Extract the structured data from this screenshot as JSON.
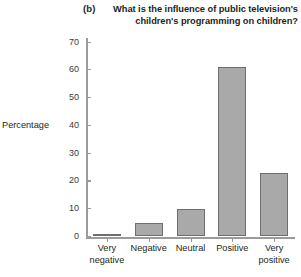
{
  "panel": {
    "label": "(b)"
  },
  "title": {
    "line1": "What is the influence of public television's",
    "line2": "children's programming on children?"
  },
  "axis": {
    "y_title": "Percentage"
  },
  "colors": {
    "bar_fill": "#a9a9a9",
    "bar_edge": "#6e6e6e",
    "axis": "#9b9b9b",
    "text": "#231f20",
    "background": "#ffffff"
  },
  "chart_data": {
    "type": "bar",
    "title": "What is the influence of public television's children's programming on children?",
    "xlabel": "",
    "ylabel": "Percentage",
    "categories": [
      "Very negative",
      "Negative",
      "Neutral",
      "Positive",
      "Very positive"
    ],
    "category_lines": [
      [
        "Very",
        "negative"
      ],
      [
        "Negative",
        ""
      ],
      [
        "Neutral",
        ""
      ],
      [
        "Positive",
        ""
      ],
      [
        "Very",
        "positive"
      ]
    ],
    "values": [
      1,
      5,
      10,
      61,
      23
    ],
    "ylim": [
      0,
      70
    ],
    "yticks": [
      0,
      10,
      20,
      30,
      40,
      50,
      60,
      70
    ],
    "ytick_labels": [
      "0",
      "10",
      "20",
      "30",
      "40",
      "50",
      "60",
      "70"
    ],
    "grid": false,
    "legend": null,
    "legend_position": "none"
  }
}
